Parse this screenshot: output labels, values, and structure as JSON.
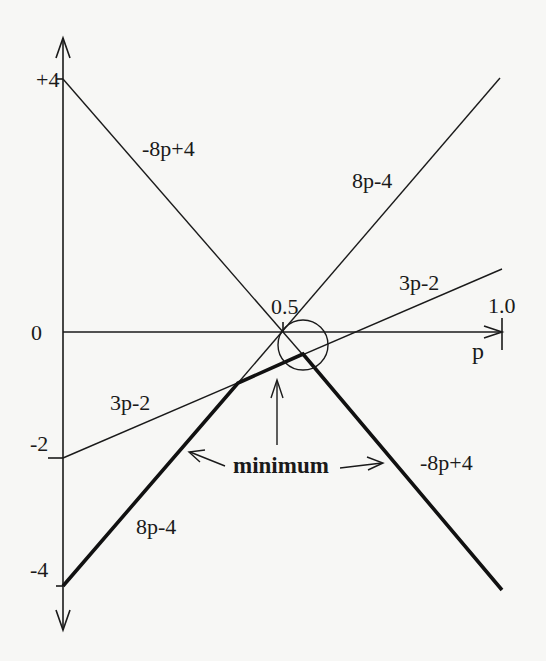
{
  "diagram": {
    "type": "piecewise-linear minimum plot",
    "axes": {
      "x_label": "p",
      "y_ticks": [
        "+4",
        "0",
        "-2",
        "-4"
      ],
      "x_ticks": [
        "0.5",
        "1.0"
      ]
    },
    "lines": [
      {
        "id": "neg8p4",
        "label": "-8p+4",
        "from": [
          0,
          4
        ],
        "to": [
          1,
          -4
        ]
      },
      {
        "id": "8p4",
        "label": "8p-4",
        "from": [
          0.5,
          0
        ],
        "to": [
          1,
          4
        ]
      },
      {
        "id": "3p2",
        "label": "3p-2",
        "from": [
          0,
          -2
        ],
        "to": [
          1,
          1
        ]
      }
    ],
    "lower_envelope": {
      "label": "minimum",
      "points": [
        [
          0,
          -4
        ],
        [
          0.4,
          -0.8
        ],
        [
          0.5454,
          -0.3636
        ],
        [
          1,
          -4
        ]
      ]
    },
    "labels": {
      "neg8p4_upper": "-8p+4",
      "8p4_upper": "8p-4",
      "3p2_upper": "3p-2",
      "3p2_lower": "3p-2",
      "8p4_lower": "8p-4",
      "neg8p4_lower": "-8p+4",
      "minimum": "minimum",
      "tick_plus4": "+4",
      "tick_zero": "0",
      "tick_minus2": "-2",
      "tick_minus4": "-4",
      "tick_half": "0.5",
      "tick_one": "1.0",
      "axis_p": "p"
    },
    "colors": {
      "ink": "#1a1a1a",
      "paper": "#f7f7f5"
    }
  }
}
